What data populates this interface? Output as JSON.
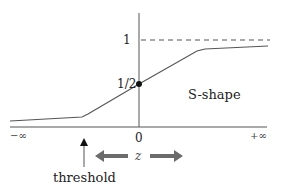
{
  "diagram": {
    "y_labels": {
      "one": "1",
      "half": "1/2"
    },
    "x_labels": {
      "neg_inf": "−∞",
      "zero": "0",
      "pos_inf": "+∞"
    },
    "curve_label": "S-shape",
    "variable_label": "z",
    "threshold_label": "threshold",
    "colors": {
      "line": "#555555",
      "arrow": "#6b6b6b",
      "text": "#222222"
    }
  }
}
